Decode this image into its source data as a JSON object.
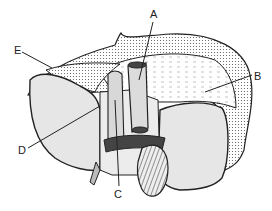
{
  "diagram": {
    "type": "anatomical-line-drawing",
    "labels": [
      {
        "id": "A",
        "text": "A",
        "x": 153,
        "y": 18
      },
      {
        "id": "B",
        "text": "B",
        "x": 255,
        "y": 78
      },
      {
        "id": "C",
        "text": "C",
        "x": 118,
        "y": 196
      },
      {
        "id": "D",
        "text": "D",
        "x": 22,
        "y": 152
      },
      {
        "id": "E",
        "text": "E",
        "x": 18,
        "y": 55
      }
    ],
    "colors": {
      "outline": "#222222",
      "lobe_fill": "#e6e6e6",
      "stipple_fill": "#f4f4f4",
      "dark_band": "#444444"
    }
  }
}
